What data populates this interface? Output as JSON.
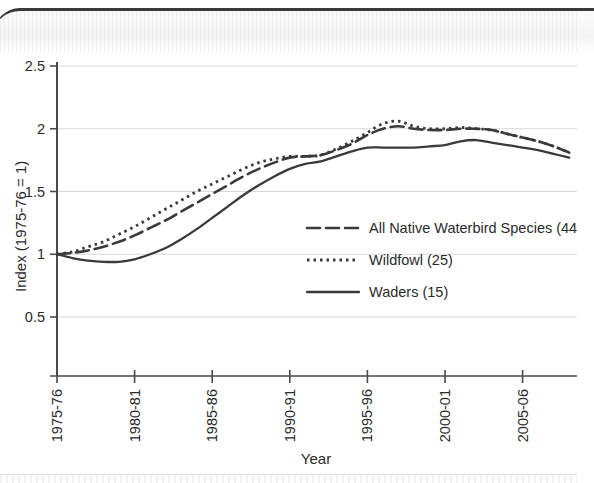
{
  "chart_data": {
    "type": "line",
    "title": "",
    "xlabel": "Year",
    "ylabel": "Index (1975-76 = 1)",
    "xlim": [
      1975,
      2008
    ],
    "ylim": [
      0.5,
      2.5
    ],
    "grid": true,
    "legend_position": "center-right",
    "x_tick_labels": [
      "1975-76",
      "1980-81",
      "1985-86",
      "1990-91",
      "1995-96",
      "2000-01",
      "2005-06"
    ],
    "x_tick_values": [
      1975,
      1980,
      1985,
      1990,
      1995,
      2000,
      2005
    ],
    "y_tick_labels": [
      "0.5",
      "1",
      "1.5",
      "2",
      "2.5"
    ],
    "y_tick_values": [
      0.5,
      1,
      1.5,
      2,
      2.5
    ],
    "x": [
      1975,
      1976,
      1977,
      1978,
      1979,
      1980,
      1981,
      1982,
      1983,
      1984,
      1985,
      1986,
      1987,
      1988,
      1989,
      1990,
      1991,
      1992,
      1993,
      1994,
      1995,
      1996,
      1997,
      1998,
      1999,
      2000,
      2001,
      2002,
      2003,
      2004,
      2005,
      2006,
      2007,
      2008
    ],
    "series": [
      {
        "name": "All Native Waterbird Species (44)",
        "style": "dashed",
        "color": "#3a3a3a",
        "values": [
          1.0,
          1.01,
          1.03,
          1.06,
          1.1,
          1.15,
          1.21,
          1.27,
          1.34,
          1.41,
          1.48,
          1.55,
          1.62,
          1.68,
          1.73,
          1.77,
          1.78,
          1.79,
          1.83,
          1.88,
          1.95,
          2.0,
          2.02,
          2.0,
          1.99,
          1.99,
          2.0,
          2.0,
          1.99,
          1.96,
          1.93,
          1.9,
          1.86,
          1.81
        ]
      },
      {
        "name": "Wildfowl (25)",
        "style": "dotted",
        "color": "#3a3a3a",
        "values": [
          1.0,
          1.02,
          1.06,
          1.1,
          1.16,
          1.22,
          1.29,
          1.36,
          1.43,
          1.5,
          1.56,
          1.62,
          1.68,
          1.73,
          1.76,
          1.78,
          1.78,
          1.79,
          1.84,
          1.9,
          1.97,
          2.04,
          2.06,
          2.02,
          2.0,
          2.0,
          2.01,
          2.0,
          1.99,
          1.96,
          1.93,
          1.9,
          1.86,
          1.81
        ]
      },
      {
        "name": "Waders (15)",
        "style": "solid",
        "color": "#3a3a3a",
        "values": [
          1.0,
          0.97,
          0.95,
          0.94,
          0.94,
          0.96,
          1.0,
          1.05,
          1.12,
          1.2,
          1.29,
          1.38,
          1.47,
          1.55,
          1.62,
          1.68,
          1.72,
          1.74,
          1.78,
          1.82,
          1.85,
          1.85,
          1.85,
          1.85,
          1.86,
          1.87,
          1.9,
          1.91,
          1.89,
          1.87,
          1.85,
          1.83,
          1.8,
          1.77
        ]
      }
    ]
  },
  "legend": {
    "entries": [
      {
        "label": "All Native Waterbird Species (44)"
      },
      {
        "label": "Wildfowl (25)"
      },
      {
        "label": "Waders (15)"
      }
    ]
  }
}
